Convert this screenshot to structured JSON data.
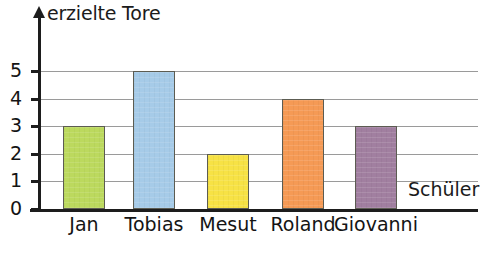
{
  "chart_data": {
    "type": "bar",
    "title": "",
    "ylabel": "erzielte Tore",
    "xlabel": "Schüler",
    "categories": [
      "Jan",
      "Tobias",
      "Mesut",
      "Roland",
      "Giovanni"
    ],
    "values": [
      3,
      5,
      2,
      4,
      3
    ],
    "series": [
      {
        "name": "erzielte Tore",
        "values": [
          3,
          5,
          2,
          4,
          3
        ]
      }
    ],
    "ylim": [
      0,
      5.6
    ],
    "yticks": [
      0,
      1,
      2,
      3,
      4,
      5
    ],
    "ytick_labels": [
      "0",
      "1",
      "2",
      "3",
      "4",
      "5"
    ],
    "grid": true,
    "grid_axis": "y",
    "legend": false,
    "bar_colors": [
      "#bcd95e",
      "#a6cbe8",
      "#f7e245",
      "#f59a55",
      "#a17fa0"
    ],
    "bar_edge_color": "#5c5c52",
    "axis_color": "#1d1d1d",
    "gridline_color": "#9a9a9a",
    "background": "#ffffff",
    "annotations": []
  },
  "axes": {
    "y_axis_label": "erzielte Tore",
    "x_axis_label": "Schüler"
  },
  "ticks": [
    {
      "label": "5",
      "value": 5
    },
    {
      "label": "4",
      "value": 4
    },
    {
      "label": "3",
      "value": 3
    },
    {
      "label": "2",
      "value": 2
    },
    {
      "label": "1",
      "value": 1
    },
    {
      "label": "0",
      "value": 0
    }
  ],
  "bars": [
    {
      "label": "Jan",
      "value": 3,
      "color": "#bcd95e"
    },
    {
      "label": "Tobias",
      "value": 5,
      "color": "#a6cbe8"
    },
    {
      "label": "Mesut",
      "value": 2,
      "color": "#f7e245"
    },
    {
      "label": "Roland",
      "value": 4,
      "color": "#f59a55"
    },
    {
      "label": "Giovanni",
      "value": 3,
      "color": "#a17fa0"
    }
  ]
}
